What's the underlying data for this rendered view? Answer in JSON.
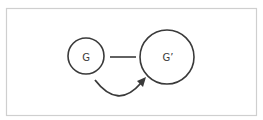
{
  "diagram": {
    "frame": {
      "x": 6.5,
      "y": 8.5,
      "width": 250,
      "height": 107,
      "stroke": "#cfcfcf"
    },
    "nodes": [
      {
        "id": "G",
        "label": "G",
        "cx": 86,
        "cy": 56,
        "r": 18
      },
      {
        "id": "G_prime",
        "label": "G’",
        "cx": 167,
        "cy": 57,
        "r": 27
      }
    ],
    "edges": [
      {
        "from": "G",
        "to": "G_prime",
        "type": "line",
        "x1": 110,
        "y1": 57,
        "x2": 136,
        "y2": 57
      }
    ],
    "arrows": [
      {
        "from": "G",
        "to": "G_prime",
        "type": "curved-arrow",
        "start": [
          95,
          80
        ],
        "control": [
          118,
          108
        ],
        "end": [
          144,
          80
        ]
      }
    ],
    "colors": {
      "stroke": "#3a3a3a",
      "frame": "#cfcfcf",
      "background": "#ffffff"
    }
  }
}
